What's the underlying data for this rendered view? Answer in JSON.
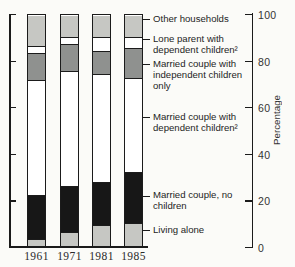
{
  "chart_data": {
    "type": "bar",
    "subtype": "stacked-percentage-bar",
    "categories": [
      "1961",
      "1971",
      "1981",
      "1985"
    ],
    "series": [
      {
        "name": "Living alone",
        "color_key": "light_gray",
        "values": [
          3,
          6,
          9,
          10
        ]
      },
      {
        "name": "Married couple, no children",
        "color_key": "black",
        "values": [
          19,
          20,
          19,
          22
        ]
      },
      {
        "name": "Married couple with dependent children²",
        "color_key": "white",
        "values": [
          50,
          50,
          47,
          41
        ]
      },
      {
        "name": "Married couple with independent children only",
        "color_key": "medium_gray",
        "values": [
          12,
          12,
          10,
          13
        ]
      },
      {
        "name": "Lone parent with dependent children²",
        "color_key": "white",
        "values": [
          3,
          3,
          6,
          5
        ]
      },
      {
        "name": "Other households",
        "color_key": "light_gray",
        "values": [
          13,
          9,
          9,
          9
        ]
      }
    ],
    "title": "",
    "xlabel": "",
    "ylabel": "Percentage",
    "ylim": [
      0,
      100
    ],
    "y_ticks": [
      0,
      20,
      40,
      60,
      80,
      100
    ],
    "grid": false,
    "legend_position": "right-inline-labels"
  },
  "colors": {
    "light_gray": "#c6c7c3",
    "medium_gray": "#8f918f",
    "black": "#171717",
    "white": "#ffffff",
    "outline": "#1b1b1b",
    "text": "#242424"
  }
}
